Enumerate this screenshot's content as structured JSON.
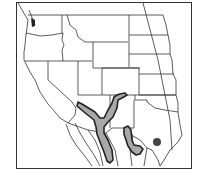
{
  "map": {
    "type": "species-range-map",
    "region": "Western United States and northern Mexico",
    "colors": {
      "background": "#ffffff",
      "border": "#333333",
      "range_fill": "#a8a8a8",
      "range_outline": "#222222",
      "point_marker": "#444444"
    },
    "range_areas": [
      {
        "id": "main-range",
        "description": "Y-shaped range through Arizona and New Mexico into Sonora/Chihuahua"
      },
      {
        "id": "secondary-range",
        "description": "Range in west Texas / Coahuila"
      }
    ],
    "point_markers": [
      {
        "id": "central-texas-point",
        "description": "Isolated record in central Texas"
      }
    ]
  }
}
